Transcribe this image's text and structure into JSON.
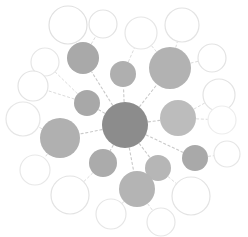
{
  "figure": {
    "type": "node-link-diagram",
    "width": 248,
    "height": 237,
    "background_color": "#ffffff"
  },
  "palette": {
    "hub_fill": "#8c8c8c",
    "tier1_fill_dark": "#a5a5a5",
    "tier1_fill_mid": "#b4b4b4",
    "tier1_fill_light": "#c3c3c3",
    "tier2_stroke": "#e3e3e3",
    "edge_color": "#c9c9c9",
    "edge_color_light": "#dcdcdc"
  },
  "chart_data": {
    "type": "scatter",
    "xlabel": "",
    "ylabel": "",
    "xlim": [
      0,
      248
    ],
    "ylim": [
      0,
      237
    ],
    "grid": false,
    "legend": "none",
    "node_count": 27,
    "edge_count": 26,
    "nodes": [
      {
        "id": "hub",
        "label": "",
        "cx": 125,
        "cy": 125,
        "r": 23,
        "style": "filled",
        "fill": "#8c8c8c",
        "tier": 0
      },
      {
        "id": "t1-a",
        "label": "",
        "cx": 83,
        "cy": 58,
        "r": 16,
        "style": "filled",
        "fill": "#a9a9a9",
        "tier": 1
      },
      {
        "id": "t1-b",
        "label": "",
        "cx": 123,
        "cy": 74,
        "r": 13,
        "style": "filled",
        "fill": "#afafaf",
        "tier": 1
      },
      {
        "id": "t1-c",
        "label": "",
        "cx": 170,
        "cy": 68,
        "r": 21,
        "style": "filled",
        "fill": "#b2b2b2",
        "tier": 1
      },
      {
        "id": "t1-d",
        "label": "",
        "cx": 87,
        "cy": 103,
        "r": 13,
        "style": "filled",
        "fill": "#a8a8a8",
        "tier": 1
      },
      {
        "id": "t1-e",
        "label": "",
        "cx": 178,
        "cy": 118,
        "r": 18,
        "style": "filled",
        "fill": "#bcbcbc",
        "tier": 1
      },
      {
        "id": "t1-f",
        "label": "",
        "cx": 60,
        "cy": 138,
        "r": 20,
        "style": "filled",
        "fill": "#b0b0b0",
        "tier": 1
      },
      {
        "id": "t1-g",
        "label": "",
        "cx": 103,
        "cy": 163,
        "r": 14,
        "style": "filled",
        "fill": "#ababab",
        "tier": 1
      },
      {
        "id": "t1-h",
        "label": "",
        "cx": 158,
        "cy": 168,
        "r": 13,
        "style": "filled",
        "fill": "#b6b6b6",
        "tier": 1
      },
      {
        "id": "t1-i",
        "label": "",
        "cx": 195,
        "cy": 158,
        "r": 13,
        "style": "filled",
        "fill": "#a9a9a9",
        "tier": 1
      },
      {
        "id": "t1-j",
        "label": "",
        "cx": 137,
        "cy": 189,
        "r": 18,
        "style": "filled",
        "fill": "#b4b4b4",
        "tier": 1
      },
      {
        "id": "t2-a",
        "label": "",
        "cx": 68,
        "cy": 25,
        "r": 19,
        "style": "hollow",
        "stroke": "#e0e0e0",
        "tier": 2
      },
      {
        "id": "t2-b",
        "label": "",
        "cx": 103,
        "cy": 24,
        "r": 14,
        "style": "hollow",
        "stroke": "#e3e3e3",
        "tier": 2
      },
      {
        "id": "t2-c",
        "label": "",
        "cx": 141,
        "cy": 33,
        "r": 16,
        "style": "hollow",
        "stroke": "#e6e6e6",
        "tier": 2
      },
      {
        "id": "t2-d",
        "label": "",
        "cx": 182,
        "cy": 25,
        "r": 17,
        "style": "hollow",
        "stroke": "#e3e3e3",
        "tier": 2
      },
      {
        "id": "t2-e",
        "label": "",
        "cx": 212,
        "cy": 58,
        "r": 14,
        "style": "hollow",
        "stroke": "#e3e3e3",
        "tier": 2
      },
      {
        "id": "t2-f",
        "label": "",
        "cx": 219,
        "cy": 95,
        "r": 16,
        "style": "hollow",
        "stroke": "#e3e3e3",
        "tier": 2
      },
      {
        "id": "t2-g",
        "label": "",
        "cx": 45,
        "cy": 62,
        "r": 14,
        "style": "hollow",
        "stroke": "#e6e6e6",
        "tier": 2
      },
      {
        "id": "t2-h",
        "label": "",
        "cx": 33,
        "cy": 86,
        "r": 15,
        "style": "hollow",
        "stroke": "#e3e3e3",
        "tier": 2
      },
      {
        "id": "t2-i",
        "label": "",
        "cx": 23,
        "cy": 119,
        "r": 17,
        "style": "hollow",
        "stroke": "#e6e6e6",
        "tier": 2
      },
      {
        "id": "t2-j",
        "label": "",
        "cx": 35,
        "cy": 170,
        "r": 15,
        "style": "hollow",
        "stroke": "#e8e8e8",
        "tier": 2
      },
      {
        "id": "t2-k",
        "label": "",
        "cx": 70,
        "cy": 195,
        "r": 19,
        "style": "hollow",
        "stroke": "#e3e3e3",
        "tier": 2
      },
      {
        "id": "t2-l",
        "label": "",
        "cx": 111,
        "cy": 214,
        "r": 15,
        "style": "hollow",
        "stroke": "#e6e6e6",
        "tier": 2
      },
      {
        "id": "t2-m",
        "label": "",
        "cx": 161,
        "cy": 222,
        "r": 14,
        "style": "hollow",
        "stroke": "#e6e6e6",
        "tier": 2
      },
      {
        "id": "t2-n",
        "label": "",
        "cx": 191,
        "cy": 196,
        "r": 19,
        "style": "hollow",
        "stroke": "#e3e3e3",
        "tier": 2
      },
      {
        "id": "t2-o",
        "label": "",
        "cx": 227,
        "cy": 154,
        "r": 13,
        "style": "hollow",
        "stroke": "#e6e6e6",
        "tier": 2
      },
      {
        "id": "t2-p",
        "label": "",
        "cx": 222,
        "cy": 120,
        "r": 14,
        "style": "hollow",
        "stroke": "#ededed",
        "tier": 2
      }
    ],
    "edges": [
      {
        "source": "hub",
        "target": "t1-a"
      },
      {
        "source": "hub",
        "target": "t1-b"
      },
      {
        "source": "hub",
        "target": "t1-c"
      },
      {
        "source": "hub",
        "target": "t1-d"
      },
      {
        "source": "hub",
        "target": "t1-e"
      },
      {
        "source": "hub",
        "target": "t1-f"
      },
      {
        "source": "hub",
        "target": "t1-g"
      },
      {
        "source": "hub",
        "target": "t1-h"
      },
      {
        "source": "hub",
        "target": "t1-i"
      },
      {
        "source": "hub",
        "target": "t1-j"
      },
      {
        "source": "t1-a",
        "target": "t2-a"
      },
      {
        "source": "t1-a",
        "target": "t2-b"
      },
      {
        "source": "t1-b",
        "target": "t2-c"
      },
      {
        "source": "t1-c",
        "target": "t2-c"
      },
      {
        "source": "t1-c",
        "target": "t2-d"
      },
      {
        "source": "t1-c",
        "target": "t2-e"
      },
      {
        "source": "t1-e",
        "target": "t2-f"
      },
      {
        "source": "t1-e",
        "target": "t2-p"
      },
      {
        "source": "t1-d",
        "target": "t2-g"
      },
      {
        "source": "t1-d",
        "target": "t2-h"
      },
      {
        "source": "t1-f",
        "target": "t2-i"
      },
      {
        "source": "t1-f",
        "target": "t2-j"
      },
      {
        "source": "t1-g",
        "target": "t2-k"
      },
      {
        "source": "t1-j",
        "target": "t2-l"
      },
      {
        "source": "t1-j",
        "target": "t2-m"
      },
      {
        "source": "t1-h",
        "target": "t2-n"
      },
      {
        "source": "t1-i",
        "target": "t2-o"
      }
    ]
  }
}
